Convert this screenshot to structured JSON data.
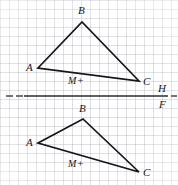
{
  "figure": {
    "background_color": "#ffffff",
    "ink_color": "#15151a",
    "grid": {
      "visible": true,
      "spacing_px": 9,
      "color": "#9696a5"
    },
    "width": 178,
    "height": 185
  },
  "fold_line": {
    "name": "H/F reference line",
    "y": 96,
    "solid_from_x": 24,
    "solid_to_x": 168,
    "color": "#2b2b30",
    "left_dashes": [
      {
        "x": 6,
        "width": 7
      },
      {
        "x": 16,
        "width": 7
      }
    ],
    "right_dashes": [
      {
        "x": 171,
        "width": 6
      }
    ],
    "labels": {
      "above": "H",
      "below": "F",
      "above_x": 158,
      "above_y": 83,
      "below_x": 159,
      "below_y": 99
    }
  },
  "shapes": [
    {
      "id": "top-triangle",
      "name": "horizontal-view-triangle",
      "vertices": [
        {
          "label": "A",
          "x": 38,
          "y": 68,
          "label_x": 26,
          "label_y": 62
        },
        {
          "label": "B",
          "x": 82,
          "y": 22,
          "label_x": 78,
          "label_y": 5
        },
        {
          "label": "C",
          "x": 139,
          "y": 81,
          "label_x": 143,
          "label_y": 76
        }
      ],
      "interior_point": {
        "label": "M",
        "marker": "+",
        "label_x": 68,
        "label_y": 75
      }
    },
    {
      "id": "bottom-triangle",
      "name": "frontal-view-triangle",
      "vertices": [
        {
          "label": "A",
          "x": 38,
          "y": 143,
          "label_x": 26,
          "label_y": 137
        },
        {
          "label": "B",
          "x": 83,
          "y": 119,
          "label_x": 79,
          "label_y": 103
        },
        {
          "label": "C",
          "x": 139,
          "y": 172,
          "label_x": 143,
          "label_y": 167
        }
      ],
      "interior_point": {
        "label": "M",
        "marker": "+",
        "label_x": 68,
        "label_y": 158
      }
    }
  ]
}
